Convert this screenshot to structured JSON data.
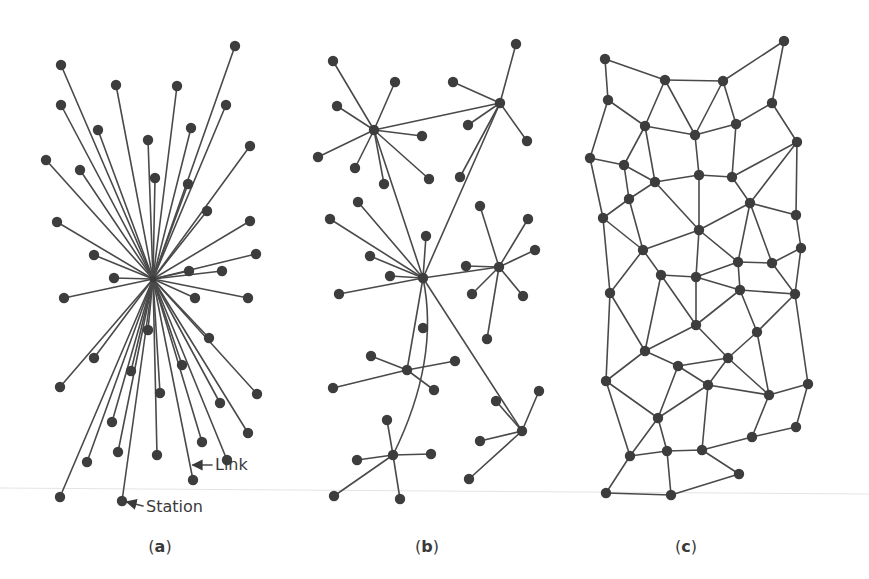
{
  "figure": {
    "panels": [
      {
        "id": "a",
        "caption": "(a)",
        "caption_letter": "a",
        "topology": "centralized",
        "hub": [
          153,
          279
        ],
        "nodes": [
          [
            61,
            65
          ],
          [
            116,
            85
          ],
          [
            177,
            86
          ],
          [
            235,
            46
          ],
          [
            61,
            105
          ],
          [
            226,
            105
          ],
          [
            98,
            130
          ],
          [
            191,
            128
          ],
          [
            148,
            140
          ],
          [
            250,
            146
          ],
          [
            46,
            160
          ],
          [
            80,
            170
          ],
          [
            155,
            178
          ],
          [
            188,
            184
          ],
          [
            207,
            211
          ],
          [
            57,
            222
          ],
          [
            250,
            221
          ],
          [
            94,
            255
          ],
          [
            256,
            254
          ],
          [
            114,
            278
          ],
          [
            64,
            298
          ],
          [
            189,
            271
          ],
          [
            222,
            271
          ],
          [
            195,
            298
          ],
          [
            248,
            298
          ],
          [
            148,
            330
          ],
          [
            209,
            338
          ],
          [
            94,
            358
          ],
          [
            131,
            371
          ],
          [
            182,
            365
          ],
          [
            60,
            387
          ],
          [
            160,
            393
          ],
          [
            257,
            394
          ],
          [
            220,
            403
          ],
          [
            112,
            422
          ],
          [
            118,
            452
          ],
          [
            87,
            462
          ],
          [
            157,
            455
          ],
          [
            202,
            442
          ],
          [
            248,
            433
          ],
          [
            227,
            460
          ],
          [
            193,
            480
          ],
          [
            60,
            497
          ],
          [
            122,
            501
          ]
        ],
        "annotations": [
          {
            "text": "Link",
            "x": 215,
            "y": 470,
            "arrow_from": [
              212,
              465
            ],
            "arrow_to": [
              193,
              465
            ]
          },
          {
            "text": "Station",
            "x": 146,
            "y": 512,
            "arrow_from": [
              143,
              506
            ],
            "arrow_to": [
              127,
              502
            ]
          }
        ]
      },
      {
        "id": "b",
        "caption": "(b)",
        "caption_letter": "b",
        "topology": "decentralized",
        "hubs": {
          "H1": [
            374,
            130
          ],
          "H2": [
            500,
            103
          ],
          "H3": [
            423,
            278
          ],
          "H4": [
            499,
            267
          ],
          "H5": [
            407,
            370
          ],
          "H6": [
            393,
            455
          ],
          "H7": [
            522,
            431
          ]
        },
        "leaves": {
          "H1": [
            [
              333,
              61
            ],
            [
              395,
              82
            ],
            [
              337,
              106
            ],
            [
              422,
              136
            ],
            [
              318,
              157
            ],
            [
              355,
              168
            ],
            [
              384,
              184
            ],
            [
              429,
              179
            ]
          ],
          "H2": [
            [
              516,
              44
            ],
            [
              453,
              82
            ],
            [
              468,
              125
            ],
            [
              527,
              141
            ],
            [
              460,
              177
            ]
          ],
          "H3": [
            [
              358,
              202
            ],
            [
              330,
              219
            ],
            [
              426,
              236
            ],
            [
              370,
              256
            ],
            [
              390,
              276
            ],
            [
              339,
              294
            ]
          ],
          "H4": [
            [
              480,
              206
            ],
            [
              528,
              219
            ],
            [
              535,
              250
            ],
            [
              466,
              266
            ],
            [
              472,
              294
            ],
            [
              523,
              296
            ],
            [
              487,
              339
            ]
          ],
          "H5": [
            [
              371,
              356
            ],
            [
              455,
              361
            ],
            [
              333,
              388
            ],
            [
              434,
              390
            ]
          ],
          "H6": [
            [
              387,
              420
            ],
            [
              357,
              460
            ],
            [
              431,
              454
            ],
            [
              334,
              496
            ],
            [
              400,
              499
            ]
          ],
          "H7": [
            [
              539,
              391
            ],
            [
              496,
              401
            ],
            [
              480,
              441
            ],
            [
              469,
              479
            ]
          ]
        },
        "hub_links": [
          [
            "H1",
            "H2"
          ],
          [
            "H1",
            "H3"
          ],
          [
            "H2",
            "H3"
          ],
          [
            "H3",
            "H4"
          ],
          [
            "H3",
            "H5"
          ],
          [
            "H3",
            "H7"
          ]
        ],
        "curved_links": [
          {
            "from": "H3",
            "to": "H6",
            "ctrl": [
              440,
              360
            ]
          }
        ],
        "isolated": [
          [
            423,
            328
          ]
        ]
      },
      {
        "id": "c",
        "caption": "(c)",
        "caption_letter": "c",
        "topology": "distributed",
        "nodes": {
          "A": [
            605,
            59
          ],
          "B": [
            665,
            80
          ],
          "C": [
            723,
            81
          ],
          "D": [
            784,
            41
          ],
          "E": [
            608,
            100
          ],
          "F": [
            645,
            126
          ],
          "G": [
            695,
            135
          ],
          "H": [
            736,
            124
          ],
          "I": [
            772,
            103
          ],
          "J": [
            797,
            142
          ],
          "K": [
            590,
            158
          ],
          "L": [
            624,
            165
          ],
          "M": [
            655,
            182
          ],
          "N": [
            699,
            175
          ],
          "O": [
            732,
            177
          ],
          "P": [
            750,
            203
          ],
          "Q": [
            796,
            215
          ],
          "R": [
            603,
            218
          ],
          "S": [
            629,
            199
          ],
          "T": [
            643,
            250
          ],
          "U": [
            699,
            230
          ],
          "V": [
            801,
            248
          ],
          "W": [
            738,
            262
          ],
          "X": [
            772,
            263
          ],
          "Y": [
            661,
            275
          ],
          "Z": [
            696,
            277
          ],
          "AA": [
            740,
            290
          ],
          "BB": [
            610,
            293
          ],
          "CC": [
            795,
            294
          ],
          "DD": [
            696,
            325
          ],
          "EE": [
            757,
            332
          ],
          "FF": [
            645,
            351
          ],
          "GG": [
            678,
            366
          ],
          "HH": [
            728,
            358
          ],
          "II": [
            708,
            385
          ],
          "JJ": [
            769,
            395
          ],
          "KK": [
            606,
            381
          ],
          "LL": [
            808,
            384
          ],
          "MM": [
            658,
            418
          ],
          "NN": [
            630,
            456
          ],
          "OO": [
            667,
            451
          ],
          "PP": [
            702,
            450
          ],
          "QQ": [
            739,
            474
          ],
          "RR": [
            752,
            437
          ],
          "SS": [
            796,
            427
          ],
          "TT": [
            606,
            493
          ],
          "UU": [
            671,
            495
          ]
        },
        "edges": [
          [
            "A",
            "B"
          ],
          [
            "B",
            "C"
          ],
          [
            "C",
            "D"
          ],
          [
            "D",
            "I"
          ],
          [
            "A",
            "E"
          ],
          [
            "E",
            "F"
          ],
          [
            "B",
            "F"
          ],
          [
            "B",
            "G"
          ],
          [
            "C",
            "G"
          ],
          [
            "C",
            "H"
          ],
          [
            "F",
            "G"
          ],
          [
            "G",
            "H"
          ],
          [
            "H",
            "I"
          ],
          [
            "I",
            "J"
          ],
          [
            "E",
            "K"
          ],
          [
            "F",
            "L"
          ],
          [
            "F",
            "M"
          ],
          [
            "G",
            "N"
          ],
          [
            "H",
            "O"
          ],
          [
            "J",
            "O"
          ],
          [
            "J",
            "P"
          ],
          [
            "J",
            "Q"
          ],
          [
            "K",
            "L"
          ],
          [
            "L",
            "M"
          ],
          [
            "L",
            "S"
          ],
          [
            "M",
            "N"
          ],
          [
            "N",
            "O"
          ],
          [
            "N",
            "U"
          ],
          [
            "M",
            "U"
          ],
          [
            "S",
            "M"
          ],
          [
            "S",
            "R"
          ],
          [
            "K",
            "R"
          ],
          [
            "R",
            "T"
          ],
          [
            "S",
            "T"
          ],
          [
            "T",
            "U"
          ],
          [
            "O",
            "P"
          ],
          [
            "P",
            "Q"
          ],
          [
            "U",
            "P"
          ],
          [
            "Q",
            "V"
          ],
          [
            "T",
            "Y"
          ],
          [
            "T",
            "BB"
          ],
          [
            "R",
            "BB"
          ],
          [
            "Y",
            "Z"
          ],
          [
            "U",
            "Z"
          ],
          [
            "U",
            "W"
          ],
          [
            "P",
            "W"
          ],
          [
            "P",
            "X"
          ],
          [
            "W",
            "X"
          ],
          [
            "X",
            "V"
          ],
          [
            "Z",
            "W"
          ],
          [
            "W",
            "AA"
          ],
          [
            "Z",
            "AA"
          ],
          [
            "AA",
            "CC"
          ],
          [
            "X",
            "CC"
          ],
          [
            "V",
            "CC"
          ],
          [
            "Y",
            "FF"
          ],
          [
            "Y",
            "DD"
          ],
          [
            "Z",
            "DD"
          ],
          [
            "DD",
            "AA"
          ],
          [
            "DD",
            "FF"
          ],
          [
            "DD",
            "HH"
          ],
          [
            "AA",
            "EE"
          ],
          [
            "EE",
            "CC"
          ],
          [
            "EE",
            "HH"
          ],
          [
            "BB",
            "FF"
          ],
          [
            "BB",
            "KK"
          ],
          [
            "FF",
            "GG"
          ],
          [
            "FF",
            "KK"
          ],
          [
            "GG",
            "HH"
          ],
          [
            "GG",
            "II"
          ],
          [
            "HH",
            "II"
          ],
          [
            "HH",
            "JJ"
          ],
          [
            "EE",
            "JJ"
          ],
          [
            "CC",
            "LL"
          ],
          [
            "JJ",
            "LL"
          ],
          [
            "II",
            "JJ"
          ],
          [
            "KK",
            "MM"
          ],
          [
            "KK",
            "NN"
          ],
          [
            "GG",
            "MM"
          ],
          [
            "II",
            "MM"
          ],
          [
            "MM",
            "NN"
          ],
          [
            "MM",
            "OO"
          ],
          [
            "NN",
            "OO"
          ],
          [
            "OO",
            "PP"
          ],
          [
            "II",
            "PP"
          ],
          [
            "PP",
            "QQ"
          ],
          [
            "PP",
            "RR"
          ],
          [
            "JJ",
            "RR"
          ],
          [
            "RR",
            "SS"
          ],
          [
            "LL",
            "SS"
          ],
          [
            "NN",
            "TT"
          ],
          [
            "TT",
            "UU"
          ],
          [
            "OO",
            "UU"
          ],
          [
            "UU",
            "QQ"
          ]
        ]
      }
    ],
    "captions": [
      {
        "text_open": "(",
        "letter": "a",
        "text_close": ")",
        "x": 160,
        "y": 552
      },
      {
        "text_open": "(",
        "letter": "b",
        "text_close": ")",
        "x": 427,
        "y": 552
      },
      {
        "text_open": "(",
        "letter": "c",
        "text_close": ")",
        "x": 686,
        "y": 552
      }
    ],
    "labels": {
      "link": "Link",
      "station": "Station"
    },
    "colors": {
      "node": "#3d3d3d",
      "edge": "#4a4a4a",
      "text": "#3a3a3a",
      "background": "#ffffff"
    }
  }
}
